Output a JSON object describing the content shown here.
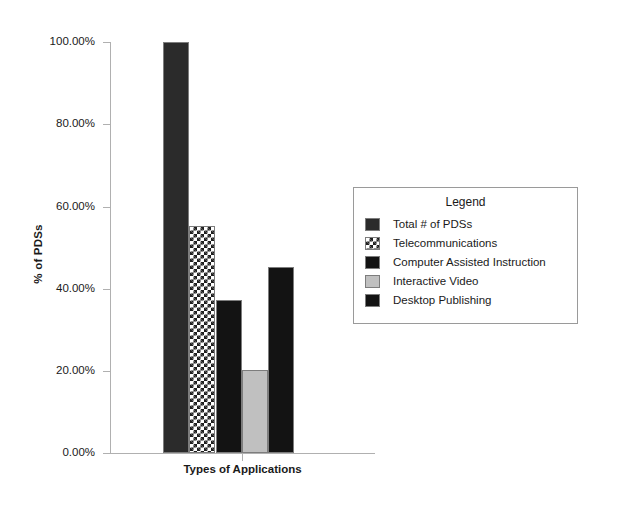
{
  "chart_data": {
    "type": "bar",
    "title": "",
    "xlabel": "Types of Applications",
    "ylabel": "% of PDSs",
    "ylim": [
      0,
      100
    ],
    "grid": false,
    "legend_position": "right",
    "legend_title": "Legend",
    "categories": [
      "Total # of PDSs",
      "Telecommunications",
      "Computer Assisted Instruction",
      "Interactive Video",
      "Desktop Publishing"
    ],
    "values": [
      100.0,
      55.2,
      37.2,
      20.2,
      45.3
    ],
    "value_labels": [
      "100.00%",
      "55.20%",
      "37.20%",
      "20.20%",
      "45.30%"
    ],
    "y_ticks": [
      {
        "value": 100,
        "label": "100.00%"
      },
      {
        "value": 80,
        "label": "80.00%"
      },
      {
        "value": 60,
        "label": "60.00%"
      },
      {
        "value": 40,
        "label": "40.00%"
      },
      {
        "value": 20,
        "label": "20.00%"
      },
      {
        "value": 0,
        "label": "0.00%"
      }
    ],
    "series_styles": [
      {
        "name": "Total # of PDSs",
        "fill": "solid",
        "color": "#2b2b2b"
      },
      {
        "name": "Telecommunications",
        "fill": "checker",
        "color": "#1f1f1f"
      },
      {
        "name": "Computer Assisted Instruction",
        "fill": "solid",
        "color": "#131313"
      },
      {
        "name": "Interactive Video",
        "fill": "solid",
        "color": "#c0c0c0"
      },
      {
        "name": "Desktop Publishing",
        "fill": "solid",
        "color": "#1f1f1f"
      }
    ]
  },
  "axes": {
    "y_title": "% of PDSs",
    "x_title": "Types of Applications",
    "tick_100": "100.00%",
    "tick_80": "80.00%",
    "tick_60": "60.00%",
    "tick_40": "40.00%",
    "tick_20": "20.00%",
    "tick_0": "0.00%"
  },
  "legend": {
    "title": "Legend",
    "items": [
      {
        "label": "Total # of PDSs"
      },
      {
        "label": "Telecommunications"
      },
      {
        "label": "Computer Assisted Instruction"
      },
      {
        "label": "Interactive Video"
      },
      {
        "label": "Desktop Publishing"
      }
    ]
  },
  "colors": {
    "axis": "#b0b0b0",
    "text": "#1a1a1a",
    "legend_border": "#9a9a9a",
    "background": "#ffffff"
  }
}
